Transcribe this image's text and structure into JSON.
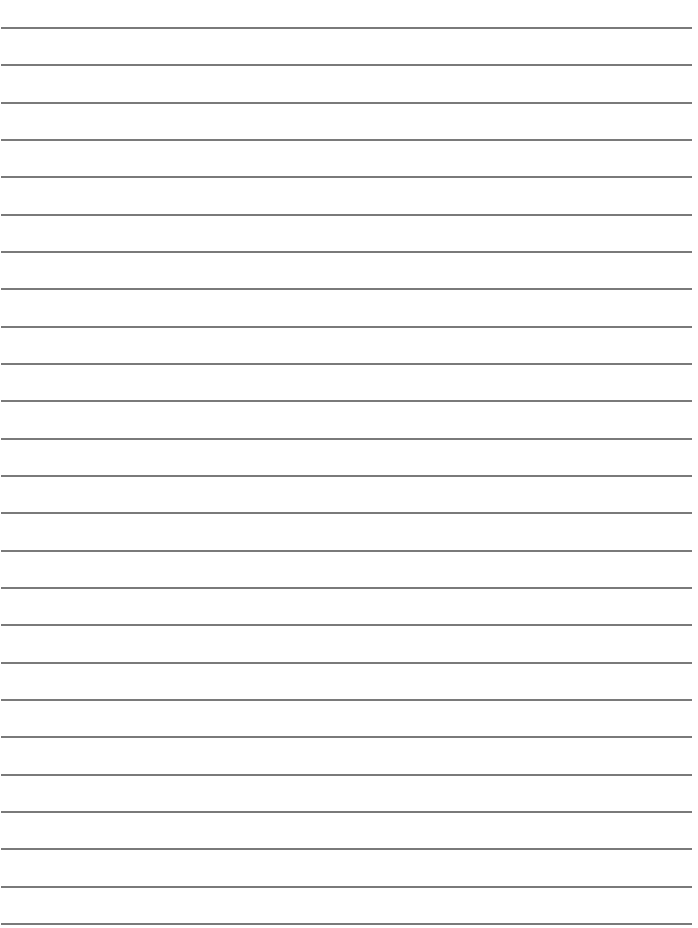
{
  "page": {
    "type": "lined-paper",
    "background_color": "#ffffff",
    "line_color": "#7a7a7a",
    "line_count": 25,
    "first_line_y": 28,
    "line_spacing": 37.33,
    "line_thickness": 2,
    "line_left": 1,
    "line_right": 692,
    "text": ""
  }
}
